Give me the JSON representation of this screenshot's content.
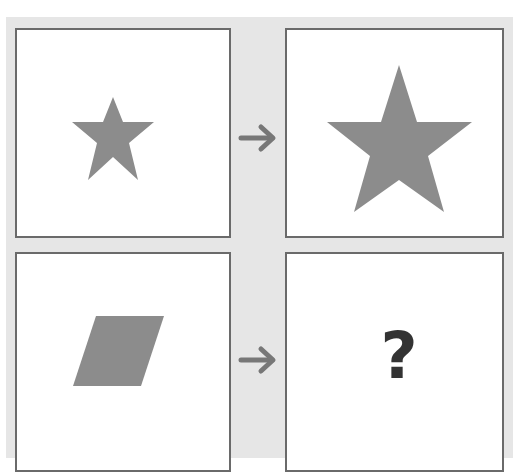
{
  "puzzle": {
    "type": "visual-analogy",
    "rows": [
      {
        "input": {
          "shape": "star",
          "size": "small",
          "color": "#8c8c8c"
        },
        "arrow": "right-arrow",
        "output": {
          "shape": "star",
          "size": "large",
          "color": "#8c8c8c"
        }
      },
      {
        "input": {
          "shape": "parallelogram",
          "size": "small",
          "color": "#8c8c8c"
        },
        "arrow": "right-arrow",
        "output": {
          "unknown_label": "?"
        }
      }
    ]
  },
  "colors": {
    "background": "#e6e6e6",
    "panel": "#ffffff",
    "panel_border": "#6a6a6a",
    "shape_fill": "#8c8c8c",
    "arrow": "#777777",
    "question_mark": "#333333"
  }
}
